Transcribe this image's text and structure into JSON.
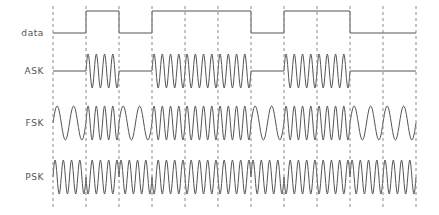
{
  "figure": {
    "background_color": "#ffffff",
    "trace_color": "#555555",
    "gridline_color": "#8a8a8a",
    "label_color": "#555555"
  },
  "rows": [
    {
      "label": "data",
      "name": "data"
    },
    {
      "label": "ASK",
      "name": "ask"
    },
    {
      "label": "FSK",
      "name": "fsk"
    },
    {
      "label": "PSK",
      "name": "psk"
    }
  ],
  "chart_data": {
    "type": "line",
    "xlabel": "",
    "ylabel": "",
    "grid": true,
    "legend_position": "left",
    "bit_count": 11,
    "bits": [
      0,
      1,
      0,
      1,
      1,
      1,
      0,
      1,
      1,
      0,
      0
    ],
    "bit_sequence_string": "01011101100",
    "x_start_px": 53,
    "x_end_px": 416,
    "bit_width_px": 33,
    "gridline_x_px": [
      53,
      86,
      119,
      152,
      185,
      218,
      251,
      284,
      317,
      350,
      383,
      416
    ],
    "series": [
      {
        "name": "data",
        "kind": "square",
        "description": "NRZ binary data; high = 1, low = 0",
        "values": [
          0,
          1,
          0,
          1,
          1,
          1,
          0,
          1,
          1,
          0,
          0
        ],
        "baseline_y_px": 33,
        "high_y_px": 11,
        "label": "data"
      },
      {
        "name": "ASK",
        "kind": "amplitude-shift-keying",
        "description": "Carrier burst present for bit = 1, zero amplitude for bit = 0",
        "values": [
          0,
          1,
          0,
          1,
          1,
          1,
          0,
          1,
          1,
          0,
          0
        ],
        "cycles_per_bit": 4,
        "amplitude_high": 1,
        "amplitude_low": 0,
        "center_y_px": 71,
        "amplitude_px": 17,
        "label": "ASK"
      },
      {
        "name": "FSK",
        "kind": "frequency-shift-keying",
        "description": "Low frequency for bit = 0, high frequency for bit = 1",
        "values": [
          0,
          1,
          0,
          1,
          1,
          1,
          0,
          1,
          1,
          0,
          0
        ],
        "cycles_per_bit_zero": 2,
        "cycles_per_bit_one": 4,
        "center_y_px": 123,
        "amplitude_px": 17,
        "label": "FSK"
      },
      {
        "name": "PSK",
        "kind": "phase-shift-keying",
        "description": "Constant amplitude and frequency; phase inverts 180 degrees when the bit value changes",
        "values": [
          0,
          1,
          0,
          1,
          1,
          1,
          0,
          1,
          1,
          0,
          0
        ],
        "cycles_per_bit": 4,
        "phase_shift_degrees": 180,
        "center_y_px": 177,
        "amplitude_px": 17,
        "label": "PSK"
      }
    ]
  }
}
